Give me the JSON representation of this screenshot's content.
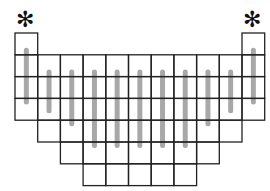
{
  "diagram": {
    "markers": {
      "symbol": "✻",
      "positions": [
        "leftmost-column",
        "rightmost-column"
      ]
    },
    "columns": [
      {
        "cells": 4,
        "top_offset_rows": 0,
        "bar_len": 2.6
      },
      {
        "cells": 4,
        "top_offset_rows": 1,
        "bar_len": 3.0
      },
      {
        "cells": 5,
        "top_offset_rows": 1,
        "bar_len": 3.6
      },
      {
        "cells": 6,
        "top_offset_rows": 1,
        "bar_len": 4.6
      },
      {
        "cells": 6,
        "top_offset_rows": 1,
        "bar_len": 4.6
      },
      {
        "cells": 6,
        "top_offset_rows": 1,
        "bar_len": 4.6
      },
      {
        "cells": 6,
        "top_offset_rows": 1,
        "bar_len": 4.6
      },
      {
        "cells": 6,
        "top_offset_rows": 1,
        "bar_len": 4.6
      },
      {
        "cells": 5,
        "top_offset_rows": 1,
        "bar_len": 3.6
      },
      {
        "cells": 4,
        "top_offset_rows": 1,
        "bar_len": 3.0
      },
      {
        "cells": 4,
        "top_offset_rows": 0,
        "bar_len": 2.6
      }
    ],
    "colors": {
      "line": "#222222",
      "bar": "#a8a8a8"
    }
  }
}
